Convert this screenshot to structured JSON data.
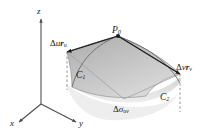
{
  "figure": {
    "kind": "3d-parametric-surface-patch-diagram",
    "background_color": "#ffffff"
  },
  "axes": {
    "z_label": "z",
    "x_label": "x",
    "y_label": "y",
    "axis_color": "#4a4a4a"
  },
  "points": {
    "p0": {
      "base": "P",
      "subscript": "0"
    }
  },
  "vectors": {
    "u_vector": {
      "delta": "Δ",
      "param": "u",
      "vector_symbol": "r",
      "subscript": "u"
    },
    "v_vector": {
      "delta": "Δ",
      "param": "v",
      "vector_symbol": "r",
      "subscript": "v"
    },
    "arrow_color": "#2b2b2b"
  },
  "curves": {
    "c1": {
      "base": "C",
      "subscript": "1"
    },
    "c2": {
      "base": "C",
      "subscript": "2"
    },
    "curve_color": "#6e6e6e"
  },
  "area_element": {
    "delta": "Δ",
    "symbol": "σ",
    "subscript": "uv"
  },
  "surface": {
    "patch_fill_top": "#b9b9b9",
    "patch_fill_bottom": "#d6d6d6",
    "patch_edge_color": "#8a8a8a",
    "shadow_fill": "#e3e3e3",
    "dashed_line_color": "#7a7a7a"
  }
}
